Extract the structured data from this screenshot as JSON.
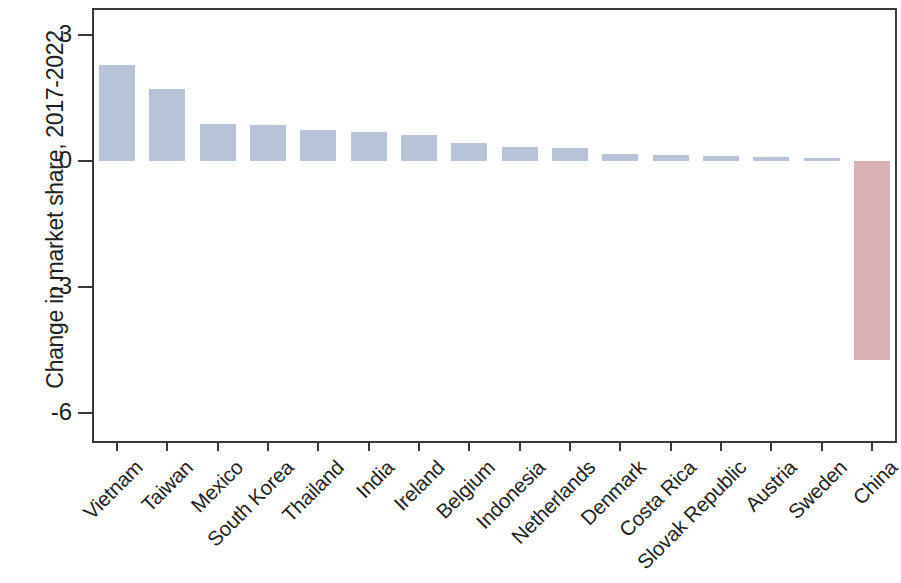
{
  "chart_data": {
    "type": "bar",
    "title": "",
    "subtitle": "",
    "xlabel": "",
    "ylabel": "Change in market share, 2017-2022",
    "ylim": [
      -6.8,
      3.6
    ],
    "yticks": [
      3,
      0,
      -3,
      -6
    ],
    "ytick_labels": [
      "3",
      "0",
      "-3",
      "-6"
    ],
    "grid": false,
    "legend": null,
    "categories": [
      "Vietnam",
      "Taiwan",
      "Mexico",
      "South Korea",
      "Thailand",
      "India",
      "Ireland",
      "Belgium",
      "Indonesia",
      "Netherlands",
      "Denmark",
      "Costa Rica",
      "Slovak Republic",
      "Austria",
      "Sweden",
      "China"
    ],
    "values": [
      2.28,
      1.72,
      0.88,
      0.85,
      0.73,
      0.68,
      0.62,
      0.43,
      0.33,
      0.3,
      0.17,
      0.14,
      0.12,
      0.1,
      0.07,
      -4.74
    ],
    "colors": {
      "positive": "#b7c4d8",
      "negative": "#d9b1b5",
      "axis": "#3a3a3a",
      "text": "#231f20",
      "background": "#ffffff"
    }
  }
}
